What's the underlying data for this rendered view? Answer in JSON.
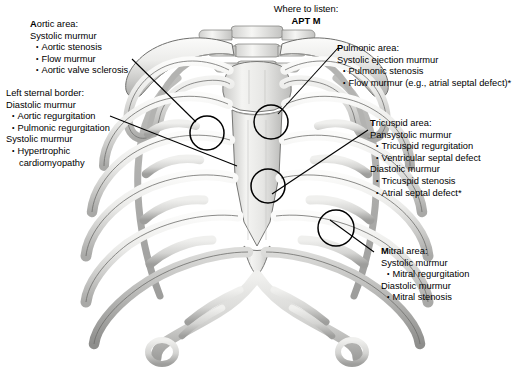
{
  "figure": {
    "where_to_listen": {
      "label": "Where to listen:",
      "mnemonic": "APT M"
    }
  },
  "annotations": {
    "aortic": {
      "header_lead": "A",
      "header_rest": "ortic area:",
      "lines": [
        {
          "type": "sub",
          "text": "Systolic murmur"
        },
        {
          "type": "bullet",
          "text": "Aortic stenosis"
        },
        {
          "type": "bullet",
          "text": "Flow murmur"
        },
        {
          "type": "bullet",
          "text": "Aortic valve sclerosis"
        }
      ]
    },
    "left_sternal_border": {
      "header_lead": "",
      "header_rest": "Left sternal border:",
      "lines": [
        {
          "type": "sub",
          "text": "Diastolic murmur"
        },
        {
          "type": "bullet",
          "text": "Aortic regurgitation"
        },
        {
          "type": "bullet",
          "text": "Pulmonic regurgitation"
        },
        {
          "type": "sub",
          "text": "Systolic murmur"
        },
        {
          "type": "bullet",
          "text": "Hypertrophic"
        },
        {
          "type": "cont",
          "text": "cardiomyopathy"
        }
      ]
    },
    "pulmonic": {
      "header_lead": "P",
      "header_rest": "ulmonic area:",
      "lines": [
        {
          "type": "sub",
          "text": "Systolic ejection murmur"
        },
        {
          "type": "bullet",
          "text": "Pulmonic stenosis"
        },
        {
          "type": "bullet",
          "text": "Flow murmur (e.g., atrial septal defect)*"
        }
      ]
    },
    "tricuspid": {
      "header_lead": "T",
      "header_rest": "ricuspid area:",
      "lines": [
        {
          "type": "sub",
          "text": "Pansystolic murmur"
        },
        {
          "type": "bullet",
          "text": "Tricuspid regurgitation"
        },
        {
          "type": "bullet",
          "text": "Ventricular septal defect"
        },
        {
          "type": "sub",
          "text": "Diastolic murmur"
        },
        {
          "type": "bullet",
          "text": "Tricuspid stenosis"
        },
        {
          "type": "bullet",
          "text": "Atrial septal defect*"
        }
      ]
    },
    "mitral": {
      "header_lead": "M",
      "header_rest": "itral area:",
      "lines": [
        {
          "type": "sub",
          "text": "Systolic murmur"
        },
        {
          "type": "bullet",
          "text": "Mitral regurgitation"
        },
        {
          "type": "sub",
          "text": "Diastolic murmur"
        },
        {
          "type": "bullet",
          "text": "Mitral stenosis"
        }
      ]
    }
  },
  "markers": [
    {
      "name": "aortic-marker",
      "cx": 207,
      "cy": 133,
      "r": 17
    },
    {
      "name": "pulmonic-marker",
      "cx": 271,
      "cy": 122,
      "r": 17
    },
    {
      "name": "tricuspid-marker",
      "cx": 268,
      "cy": 186,
      "r": 17
    },
    {
      "name": "mitral-marker",
      "cx": 336,
      "cy": 228,
      "r": 18
    }
  ],
  "colors": {
    "bone_light": "#f2f2f0",
    "bone_mid": "#d8d8d6",
    "bone_shadow": "#a8a8a6",
    "cartilage": "#9a9a98",
    "outline": "#5a5a58",
    "text": "#000000",
    "background": "#ffffff"
  }
}
